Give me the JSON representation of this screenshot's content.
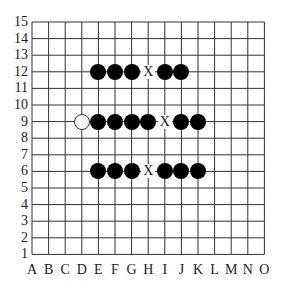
{
  "board": {
    "size": 15,
    "columns": [
      "A",
      "B",
      "C",
      "D",
      "E",
      "F",
      "G",
      "H",
      "I",
      "J",
      "K",
      "L",
      "M",
      "N",
      "O"
    ],
    "rows": [
      "15",
      "14",
      "13",
      "12",
      "11",
      "10",
      "9",
      "8",
      "7",
      "6",
      "5",
      "4",
      "3",
      "2",
      "1"
    ],
    "line_color": "#333333",
    "stones": [
      {
        "col": "E",
        "row": 12,
        "color": "black"
      },
      {
        "col": "F",
        "row": 12,
        "color": "black"
      },
      {
        "col": "G",
        "row": 12,
        "color": "black"
      },
      {
        "col": "I",
        "row": 12,
        "color": "black"
      },
      {
        "col": "J",
        "row": 12,
        "color": "black"
      },
      {
        "col": "D",
        "row": 9,
        "color": "white"
      },
      {
        "col": "E",
        "row": 9,
        "color": "black"
      },
      {
        "col": "F",
        "row": 9,
        "color": "black"
      },
      {
        "col": "G",
        "row": 9,
        "color": "black"
      },
      {
        "col": "H",
        "row": 9,
        "color": "black"
      },
      {
        "col": "J",
        "row": 9,
        "color": "black"
      },
      {
        "col": "K",
        "row": 9,
        "color": "black"
      },
      {
        "col": "E",
        "row": 6,
        "color": "black"
      },
      {
        "col": "F",
        "row": 6,
        "color": "black"
      },
      {
        "col": "G",
        "row": 6,
        "color": "black"
      },
      {
        "col": "I",
        "row": 6,
        "color": "black"
      },
      {
        "col": "J",
        "row": 6,
        "color": "black"
      },
      {
        "col": "K",
        "row": 6,
        "color": "black"
      }
    ],
    "marks": [
      {
        "col": "H",
        "row": 12,
        "label": "X"
      },
      {
        "col": "I",
        "row": 9,
        "label": "X"
      },
      {
        "col": "H",
        "row": 6,
        "label": "X"
      }
    ]
  }
}
